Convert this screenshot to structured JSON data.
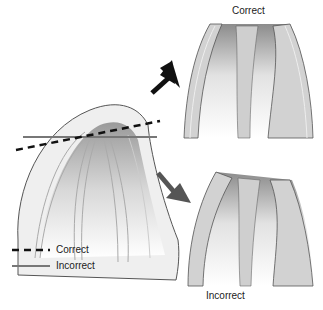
{
  "diagram": {
    "top_label": "Correct",
    "bottom_label": "Incorrect",
    "legend": [
      {
        "style": "dashed",
        "color": "#111111",
        "label": "Correct"
      },
      {
        "style": "solid",
        "color": "#777777",
        "label": "Incorrect"
      }
    ],
    "arrows": [
      {
        "direction": "up-right",
        "color": "#111111",
        "target": "Correct"
      },
      {
        "direction": "down-right",
        "color": "#555555",
        "target": "Incorrect"
      }
    ]
  }
}
